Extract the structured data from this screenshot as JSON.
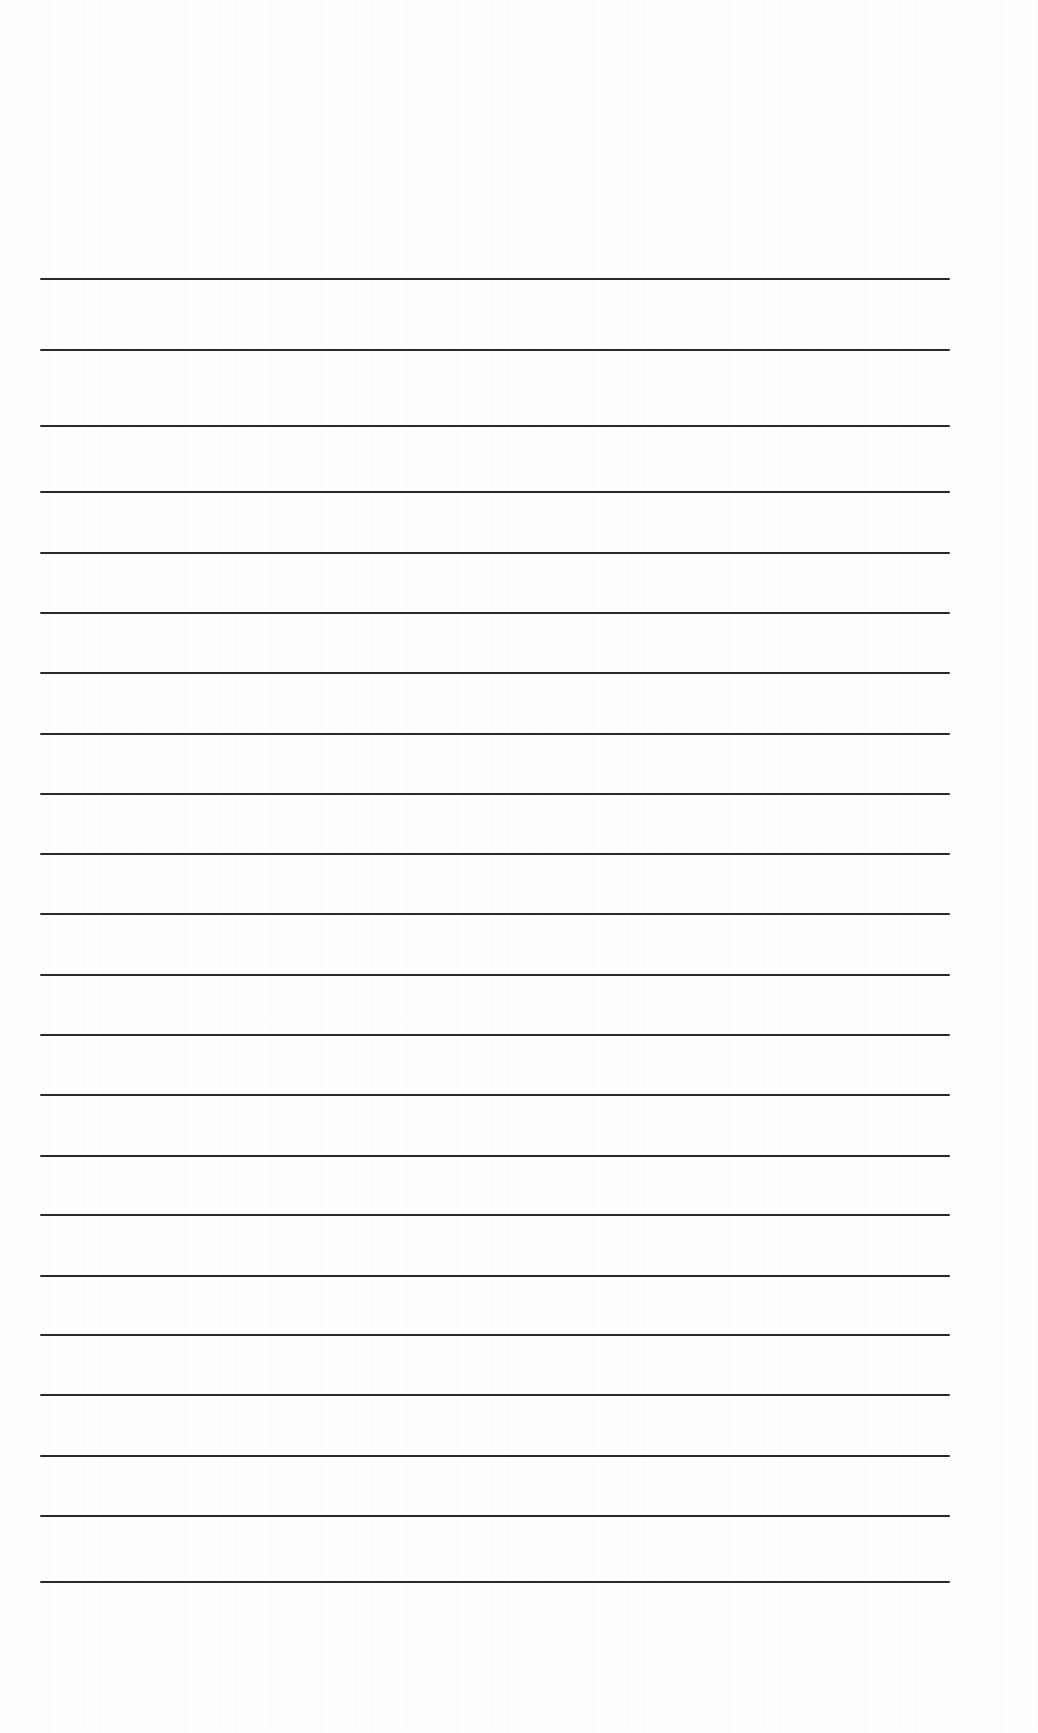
{
  "page": {
    "type": "lined-paper",
    "background_color": "#fefefe",
    "line_color": "#2a2a2a",
    "line_left_x": 40,
    "line_right_x": 950,
    "lines_y": [
      278,
      349,
      425,
      491,
      552,
      612,
      672,
      733,
      793,
      853,
      913,
      974,
      1034,
      1094,
      1155,
      1214,
      1275,
      1334,
      1394,
      1455,
      1515,
      1581
    ],
    "line_count": 22
  }
}
